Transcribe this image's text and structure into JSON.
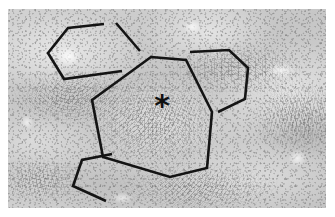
{
  "figure": {
    "kind": "histology-micrograph",
    "modality": "light microscopy",
    "stain_tone": "grayscale",
    "panel": {
      "x": 8,
      "y": 9,
      "width": 318,
      "height": 199,
      "background_color": "#c9c9c9",
      "border_color": "#ffffff"
    },
    "page_background": "#ffffff"
  },
  "markers": [
    {
      "id": "central-asterisk",
      "glyph": "✳",
      "symbol": "*",
      "meaning": "region-of-interest marker",
      "color": "#101010",
      "x": 162,
      "y": 106
    }
  ],
  "annotations": {
    "stroke_color": "#141414",
    "stroke_width": 2.6,
    "shapes": [
      {
        "id": "central-heptagon",
        "label": "central polygon",
        "closed": true,
        "sides": 7,
        "points": [
          [
            151,
            57
          ],
          [
            186,
            60
          ],
          [
            212,
            112
          ],
          [
            207,
            168
          ],
          [
            170,
            177
          ],
          [
            103,
            157
          ],
          [
            92,
            100
          ]
        ]
      },
      {
        "id": "upper-left-polygon",
        "label": "upper-left partial polygon",
        "closed": false,
        "points": [
          [
            104,
            24
          ],
          [
            68,
            28
          ],
          [
            48,
            53
          ],
          [
            64,
            79
          ],
          [
            122,
            71
          ]
        ]
      },
      {
        "id": "upper-left-stub",
        "label": "upper-left short edge",
        "closed": false,
        "points": [
          [
            116,
            23
          ],
          [
            140,
            51
          ]
        ]
      },
      {
        "id": "right-polygon",
        "label": "right partial polygon",
        "closed": false,
        "points": [
          [
            190,
            52
          ],
          [
            229,
            50
          ],
          [
            248,
            68
          ],
          [
            245,
            99
          ],
          [
            218,
            112
          ]
        ]
      },
      {
        "id": "lower-left-polygon",
        "label": "lower-left partial polygon",
        "closed": false,
        "points": [
          [
            112,
            154
          ],
          [
            82,
            160
          ],
          [
            73,
            186
          ],
          [
            106,
            201
          ]
        ]
      }
    ]
  }
}
